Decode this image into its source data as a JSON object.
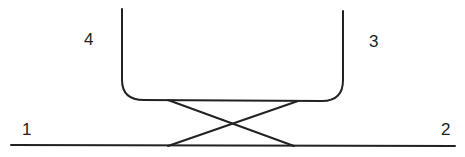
{
  "diagram": {
    "labels": [
      {
        "id": "label-1",
        "text": "1",
        "x": 22,
        "y": 135
      },
      {
        "id": "label-2",
        "text": "2",
        "x": 441,
        "y": 135
      },
      {
        "id": "label-3",
        "text": "3",
        "x": 369,
        "y": 47
      },
      {
        "id": "label-4",
        "text": "4",
        "x": 84,
        "y": 45
      }
    ],
    "colors": {
      "line": "#222222",
      "background": "#ffffff"
    }
  }
}
